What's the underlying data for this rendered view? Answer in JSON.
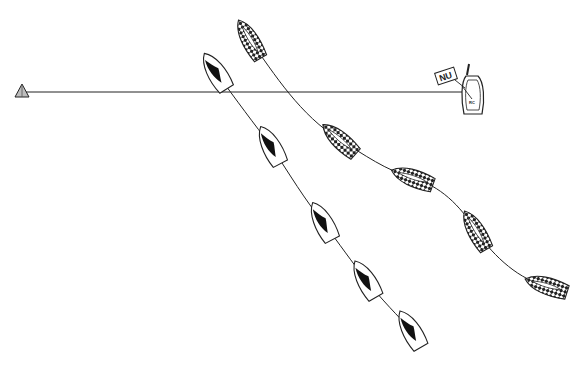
{
  "diagram": {
    "background": "#ffffff",
    "stroke_color": "#222222",
    "start_line": {
      "from": [
        22,
        92
      ],
      "to": [
        462,
        92
      ],
      "pin_mark": {
        "name": "pin-end-buoy",
        "position": [
          22,
          92
        ],
        "fill": "#bdbdbd"
      },
      "committee_boat": {
        "name": "race-committee-boat",
        "label": "RC",
        "position": [
          476,
          98
        ]
      },
      "flag": {
        "name": "signal-flag",
        "label": "NU",
        "position": [
          446,
          76
        ]
      }
    },
    "boats": [
      {
        "name": "boat-solid",
        "pattern": "solid-sail",
        "positions": [
          {
            "x": 216,
            "y": 72,
            "angle": -32
          },
          {
            "x": 271,
            "y": 146,
            "angle": -28
          },
          {
            "x": 323,
            "y": 222,
            "angle": -28
          },
          {
            "x": 366,
            "y": 280,
            "angle": -30
          },
          {
            "x": 411,
            "y": 330,
            "angle": -30
          }
        ]
      },
      {
        "name": "boat-checkered",
        "pattern": "checkered-hull",
        "positions": [
          {
            "x": 250,
            "y": 40,
            "angle": -30
          },
          {
            "x": 340,
            "y": 140,
            "angle": -48
          },
          {
            "x": 413,
            "y": 178,
            "angle": -70
          },
          {
            "x": 476,
            "y": 231,
            "angle": -30
          },
          {
            "x": 547,
            "y": 286,
            "angle": -72
          }
        ]
      }
    ]
  }
}
